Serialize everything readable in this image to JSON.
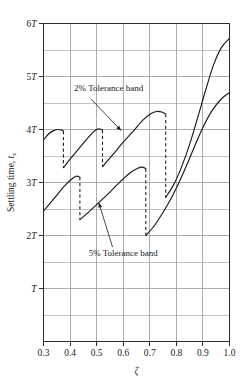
{
  "chart_data": {
    "type": "line",
    "title": "",
    "xlabel": "ζ",
    "ylabel": "Settling time, t",
    "ylabel_sub": "s",
    "xlim": [
      0.3,
      1.0
    ],
    "ylim": [
      0,
      6
    ],
    "grid": true,
    "legend_position": "none",
    "x_ticks": [
      "0.3",
      "0.4",
      "0.5",
      "0.6",
      "0.7",
      "0.8",
      "0.9",
      "1.0"
    ],
    "x_tick_values": [
      0.3,
      0.4,
      0.5,
      0.6,
      0.7,
      0.8,
      0.9,
      1.0
    ],
    "y_ticks": [
      "T",
      "2T",
      "3T",
      "4T",
      "5T",
      "6T"
    ],
    "y_tick_values": [
      1,
      2,
      3,
      4,
      5,
      6
    ],
    "y_minor_step": 0.5,
    "series": [
      {
        "name": "2% Tolerance band",
        "color": "#1a1a1a",
        "style": "solid",
        "segments": [
          [
            [
              0.3,
              3.8
            ],
            [
              0.32,
              3.92
            ],
            [
              0.34,
              3.98
            ],
            [
              0.355,
              4.0
            ],
            [
              0.368,
              3.99
            ],
            [
              0.375,
              3.97
            ]
          ],
          [
            [
              0.375,
              3.28
            ],
            [
              0.4,
              3.44
            ],
            [
              0.43,
              3.62
            ],
            [
              0.46,
              3.8
            ],
            [
              0.485,
              3.94
            ],
            [
              0.5,
              4.0
            ],
            [
              0.512,
              4.01
            ],
            [
              0.522,
              3.99
            ]
          ],
          [
            [
              0.522,
              3.3
            ],
            [
              0.56,
              3.52
            ],
            [
              0.6,
              3.76
            ],
            [
              0.64,
              3.98
            ],
            [
              0.675,
              4.18
            ],
            [
              0.705,
              4.3
            ],
            [
              0.725,
              4.34
            ],
            [
              0.745,
              4.33
            ],
            [
              0.76,
              4.29
            ]
          ],
          [
            [
              0.76,
              2.72
            ],
            [
              0.79,
              2.96
            ],
            [
              0.82,
              3.3
            ],
            [
              0.85,
              3.72
            ],
            [
              0.88,
              4.22
            ],
            [
              0.91,
              4.74
            ],
            [
              0.94,
              5.22
            ],
            [
              0.97,
              5.55
            ],
            [
              1.0,
              5.72
            ]
          ]
        ],
        "drops": [
          {
            "x": 0.375,
            "y_top": 3.97,
            "y_bottom": 3.28
          },
          {
            "x": 0.522,
            "y_top": 3.99,
            "y_bottom": 3.3
          },
          {
            "x": 0.76,
            "y_top": 4.29,
            "y_bottom": 2.72
          }
        ]
      },
      {
        "name": "5% Tolerance band",
        "color": "#1a1a1a",
        "style": "solid",
        "segments": [
          [
            [
              0.3,
              2.46
            ],
            [
              0.34,
              2.7
            ],
            [
              0.38,
              2.94
            ],
            [
              0.41,
              3.08
            ],
            [
              0.425,
              3.12
            ],
            [
              0.437,
              3.1
            ]
          ],
          [
            [
              0.437,
              2.3
            ],
            [
              0.47,
              2.44
            ],
            [
              0.51,
              2.63
            ],
            [
              0.55,
              2.82
            ],
            [
              0.59,
              3.02
            ],
            [
              0.625,
              3.18
            ],
            [
              0.655,
              3.27
            ],
            [
              0.672,
              3.29
            ],
            [
              0.685,
              3.26
            ]
          ],
          [
            [
              0.685,
              2.0
            ],
            [
              0.715,
              2.17
            ],
            [
              0.75,
              2.44
            ],
            [
              0.78,
              2.7
            ],
            [
              0.81,
              3.0
            ],
            [
              0.84,
              3.34
            ],
            [
              0.87,
              3.7
            ],
            [
              0.9,
              4.04
            ],
            [
              0.935,
              4.36
            ],
            [
              0.97,
              4.58
            ],
            [
              1.0,
              4.7
            ]
          ]
        ],
        "drops": [
          {
            "x": 0.437,
            "y_top": 3.1,
            "y_bottom": 2.3
          },
          {
            "x": 0.685,
            "y_top": 3.26,
            "y_bottom": 2.0
          }
        ]
      }
    ],
    "annotations": [
      {
        "label": "2% Tolerance band",
        "text_x": 0.415,
        "text_y": 4.72,
        "leader_from": [
          0.478,
          4.58
        ],
        "leader_to": [
          0.592,
          3.98
        ],
        "arrow": true
      },
      {
        "label": "5% Tolerance band",
        "text_x": 0.47,
        "text_y": 1.62,
        "leader_from": [
          0.56,
          1.78
        ],
        "leader_to": [
          0.508,
          2.62
        ],
        "arrow": true
      }
    ]
  },
  "axes": {
    "frame_color": "#2b2b2b",
    "grid_color": "#9a9a9a",
    "background": "#ffffff"
  }
}
